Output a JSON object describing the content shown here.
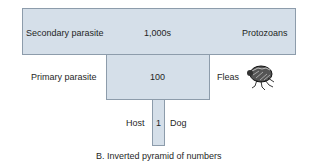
{
  "diagram": {
    "title": "B. Inverted pyramid of numbers",
    "levels": [
      {
        "level": "Secondary parasite",
        "count": "1,000s",
        "organism": "Protozoans"
      },
      {
        "level": "Primary parasite",
        "count": "100",
        "organism": "Fleas"
      },
      {
        "level": "Host",
        "count": "1",
        "organism": "Dog"
      }
    ],
    "colors": {
      "fill": "#d5dfe9",
      "border": "#8d9cab"
    },
    "icons": {
      "flea": "flea-illustration"
    }
  }
}
